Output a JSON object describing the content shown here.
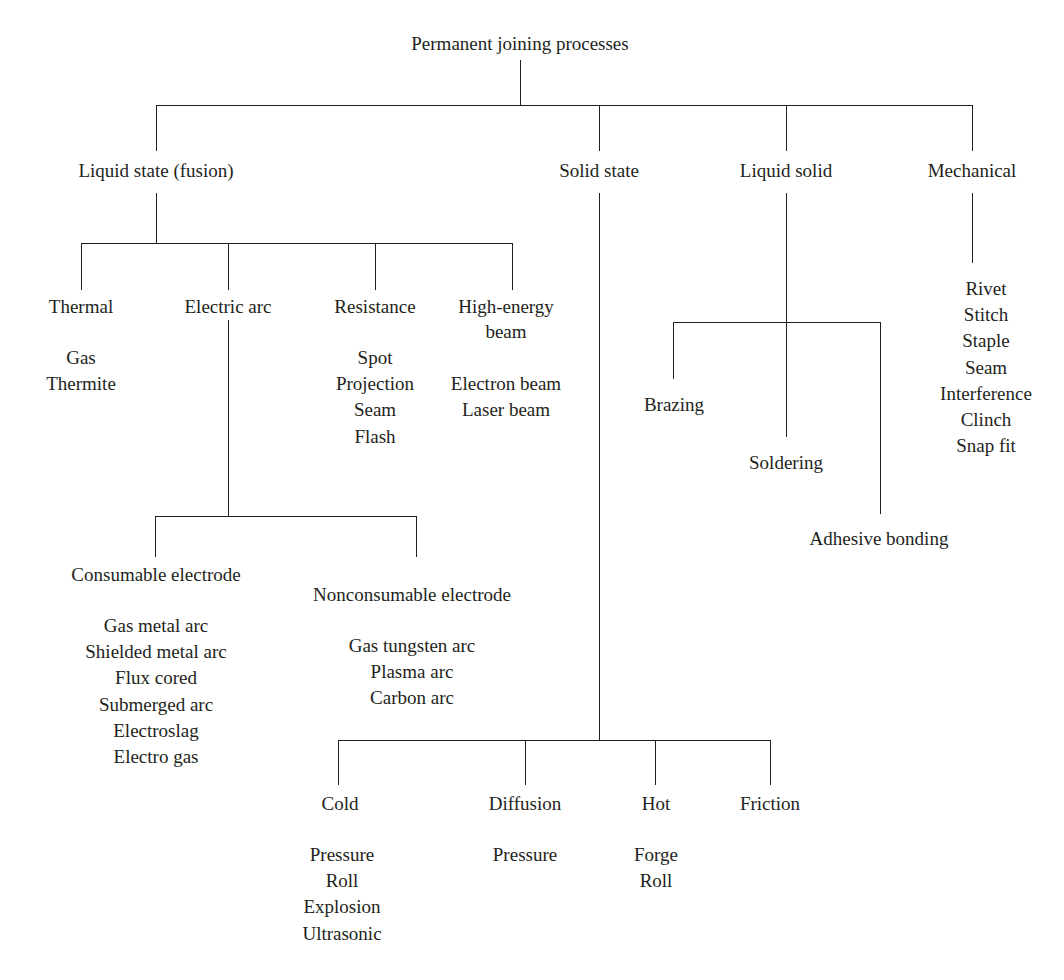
{
  "diagram": {
    "title": "Permanent joining processes",
    "root": {
      "label": "Permanent joining processes"
    },
    "level1": {
      "liquid_state": "Liquid state (fusion)",
      "solid_state": "Solid state",
      "liquid_solid": "Liquid solid",
      "mechanical": "Mechanical"
    },
    "fusion_children": {
      "thermal": "Thermal",
      "electric_arc": "Electric arc",
      "resistance": "Resistance",
      "high_energy_beam_line1": "High-energy",
      "high_energy_beam_line2": "beam"
    },
    "thermal_items": [
      "Gas",
      "Thermite"
    ],
    "resistance_items": [
      "Spot",
      "Projection",
      "Seam",
      "Flash"
    ],
    "high_energy_items": [
      "Electron beam",
      "Laser beam"
    ],
    "electrode": {
      "consumable": "Consumable electrode",
      "nonconsumable": "Nonconsumable electrode"
    },
    "consumable_items": [
      "Gas metal arc",
      "Shielded metal arc",
      "Flux cored",
      "Submerged arc",
      "Electroslag",
      "Electro gas"
    ],
    "nonconsumable_items": [
      "Gas tungsten arc",
      "Plasma arc",
      "Carbon arc"
    ],
    "solid_state_children": {
      "cold": "Cold",
      "diffusion": "Diffusion",
      "hot": "Hot",
      "friction": "Friction"
    },
    "cold_items": [
      "Pressure",
      "Roll",
      "Explosion",
      "Ultrasonic"
    ],
    "diffusion_items": [
      "Pressure"
    ],
    "hot_items": [
      "Forge",
      "Roll"
    ],
    "friction_items": [],
    "liquid_solid_children": {
      "brazing": "Brazing",
      "soldering": "Soldering",
      "adhesive_bonding": "Adhesive bonding"
    },
    "mechanical_items": [
      "Rivet",
      "Stitch",
      "Staple",
      "Seam",
      "Interference",
      "Clinch",
      "Snap fit"
    ],
    "colors": {
      "text": "#231f20",
      "line": "#231f20",
      "background": "#ffffff"
    }
  }
}
